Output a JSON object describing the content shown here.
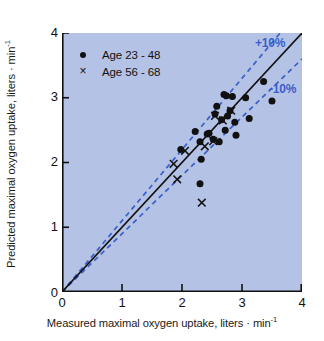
{
  "chart_data": {
    "type": "scatter",
    "title": "",
    "xlabel": "Measured maximal oxygen uptake, liters · min",
    "xlabel_sup": "-1",
    "ylabel": "Predicted maximal oxygen uptake, liters · min",
    "ylabel_sup": "-1",
    "xlim": [
      0,
      4
    ],
    "ylim": [
      0,
      4
    ],
    "xticks": [
      0,
      1,
      2,
      3,
      4
    ],
    "yticks": [
      0,
      1,
      2,
      3,
      4
    ],
    "grid": false,
    "background_color": "#b4c2e6",
    "reference_line": {
      "label": "identity",
      "slope": 1.0,
      "intercept": 0,
      "color": "#111111",
      "style": "solid"
    },
    "bands": [
      {
        "label": "+10%",
        "slope": 1.1,
        "intercept": 0,
        "color": "#3a5fc8",
        "style": "dashed"
      },
      {
        "label": "-10%",
        "slope": 0.9,
        "intercept": 0,
        "color": "#3a5fc8",
        "style": "dashed"
      }
    ],
    "annotations": [
      {
        "text": "+10%",
        "color": "#3a5fc8"
      },
      {
        "text": "-10%",
        "color": "#3a5fc8"
      }
    ],
    "legend_position": "upper left",
    "series": [
      {
        "name": "Age 23 - 48",
        "marker": "circle",
        "color": "#111111",
        "points": [
          [
            1.98,
            2.2
          ],
          [
            2.22,
            2.48
          ],
          [
            2.3,
            2.32
          ],
          [
            2.32,
            2.05
          ],
          [
            2.3,
            1.67
          ],
          [
            2.42,
            2.44
          ],
          [
            2.45,
            2.45
          ],
          [
            2.52,
            2.36
          ],
          [
            2.55,
            2.75
          ],
          [
            2.58,
            2.87
          ],
          [
            2.62,
            2.32
          ],
          [
            2.66,
            2.66
          ],
          [
            2.7,
            3.05
          ],
          [
            2.72,
            2.5
          ],
          [
            2.74,
            3.03
          ],
          [
            2.76,
            2.72
          ],
          [
            2.8,
            2.8
          ],
          [
            2.84,
            3.02
          ],
          [
            2.88,
            2.62
          ],
          [
            2.9,
            2.42
          ],
          [
            3.06,
            3.0
          ],
          [
            3.12,
            2.68
          ],
          [
            3.36,
            3.25
          ],
          [
            3.5,
            2.95
          ]
        ]
      },
      {
        "name": "Age 56 - 68",
        "marker": "x",
        "color": "#111111",
        "points": [
          [
            1.86,
            1.98
          ],
          [
            1.92,
            1.74
          ],
          [
            2.05,
            2.18
          ],
          [
            2.33,
            1.38
          ],
          [
            2.38,
            2.25
          ],
          [
            2.52,
            2.33
          ],
          [
            2.55,
            2.72
          ],
          [
            2.68,
            2.65
          ],
          [
            2.82,
            2.8
          ]
        ]
      }
    ]
  },
  "legend": {
    "items": [
      {
        "marker": "dot",
        "marker_glyph": "",
        "label": "Age 23 - 48"
      },
      {
        "marker": "x",
        "marker_glyph": "×",
        "label": "Age 56 - 68"
      }
    ]
  },
  "axes": {
    "x_tick_labels": [
      "0",
      "1",
      "2",
      "3",
      "4"
    ],
    "y_tick_labels": [
      "0",
      "1",
      "2",
      "3",
      "4"
    ]
  }
}
